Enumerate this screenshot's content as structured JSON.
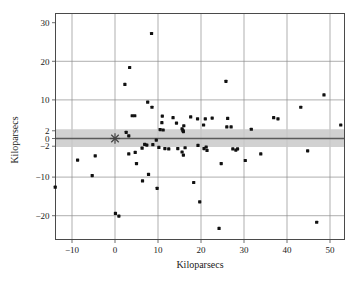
{
  "chart_data": {
    "type": "scatter",
    "title": "",
    "xlabel": "Kiloparsecs",
    "ylabel": "Kiloparsecs",
    "xlim": [
      -14.5,
      53.5
    ],
    "ylim": [
      -24.5,
      30
    ],
    "xticks": [
      -10,
      0,
      10,
      20,
      30,
      40,
      50
    ],
    "xticklabels": [
      "-10",
      "0",
      "10",
      "20",
      "30",
      "40",
      "50"
    ],
    "yticks": [
      30,
      20,
      10,
      2,
      0,
      -2,
      -10,
      -20
    ],
    "yticklabels": [
      "30",
      "20",
      "10",
      "2",
      "0",
      "-2",
      "-10",
      "-20"
    ],
    "grid": true,
    "gridlines_x": [
      -10,
      0,
      10,
      20,
      30,
      40,
      50
    ],
    "gridlines_y": [
      20,
      10,
      0,
      -10,
      -20
    ],
    "legend": "none",
    "annotations": [
      {
        "name": "origin-star-marker",
        "x": 0,
        "y": 0,
        "marker": "asterisk"
      },
      {
        "name": "horizontal-shaded-band",
        "y_low": -2.2,
        "y_high": 2.4,
        "color": "#c9c9c9"
      },
      {
        "name": "zero-reference-line",
        "y": 0,
        "color": "#5a5a5a"
      }
    ],
    "points": [
      [
        8.5,
        27.2
      ],
      [
        3.4,
        18.4
      ],
      [
        2.3,
        14.0
      ],
      [
        25.8,
        14.8
      ],
      [
        48.6,
        11.3
      ],
      [
        7.6,
        9.4
      ],
      [
        8.6,
        8.1
      ],
      [
        43.2,
        8.1
      ],
      [
        11.0,
        5.8
      ],
      [
        4.0,
        5.9
      ],
      [
        4.6,
        5.9
      ],
      [
        13.5,
        5.4
      ],
      [
        17.6,
        5.6
      ],
      [
        19.2,
        5.1
      ],
      [
        21.0,
        5.1
      ],
      [
        22.6,
        5.3
      ],
      [
        26.2,
        5.2
      ],
      [
        36.9,
        5.4
      ],
      [
        37.9,
        5.1
      ],
      [
        52.5,
        3.5
      ],
      [
        10.9,
        4.1
      ],
      [
        14.3,
        4.0
      ],
      [
        16.0,
        3.3
      ],
      [
        20.6,
        3.5
      ],
      [
        26.0,
        3.0
      ],
      [
        27.0,
        3.0
      ],
      [
        31.7,
        2.4
      ],
      [
        10.5,
        2.3
      ],
      [
        11.2,
        2.2
      ],
      [
        15.6,
        2.5
      ],
      [
        15.8,
        2.1
      ],
      [
        15.9,
        1.8
      ],
      [
        2.6,
        1.6
      ],
      [
        3.2,
        0.7
      ],
      [
        9.6,
        -0.4
      ],
      [
        6.9,
        -1.5
      ],
      [
        7.4,
        -1.7
      ],
      [
        8.8,
        -1.6
      ],
      [
        19.3,
        -1.8
      ],
      [
        10.2,
        -2.3
      ],
      [
        6.3,
        -2.5
      ],
      [
        11.6,
        -2.6
      ],
      [
        12.5,
        -2.7
      ],
      [
        14.6,
        -2.6
      ],
      [
        16.3,
        -2.4
      ],
      [
        20.7,
        -2.6
      ],
      [
        21.2,
        -2.2
      ],
      [
        21.4,
        -3.1
      ],
      [
        27.4,
        -2.7
      ],
      [
        28.1,
        -3.0
      ],
      [
        28.5,
        -2.7
      ],
      [
        44.8,
        -3.2
      ],
      [
        -8.7,
        -5.6
      ],
      [
        -4.6,
        -4.5
      ],
      [
        3.2,
        -4.0
      ],
      [
        4.7,
        -3.6
      ],
      [
        15.6,
        -3.5
      ],
      [
        15.9,
        -4.3
      ],
      [
        33.9,
        -4.0
      ],
      [
        5.0,
        -6.5
      ],
      [
        24.7,
        -6.5
      ],
      [
        30.3,
        -5.7
      ],
      [
        -5.3,
        -9.6
      ],
      [
        7.8,
        -9.3
      ],
      [
        6.4,
        -11.0
      ],
      [
        -13.9,
        -12.6
      ],
      [
        9.8,
        -12.9
      ],
      [
        18.3,
        -11.4
      ],
      [
        19.7,
        -16.4
      ],
      [
        0.1,
        -19.4
      ],
      [
        0.9,
        -20.1
      ],
      [
        24.2,
        -23.3
      ],
      [
        46.9,
        -21.7
      ]
    ]
  },
  "axes": {
    "x_title": "Kiloparsecs",
    "y_title": "Kiloparsecs"
  }
}
